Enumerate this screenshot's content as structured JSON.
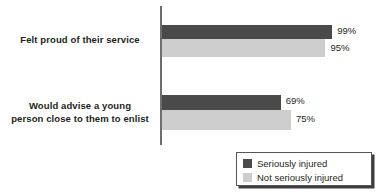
{
  "chart_data": {
    "type": "bar",
    "orientation": "horizontal",
    "title": "",
    "subtitle": "",
    "xlabel": "",
    "ylabel": "",
    "grid": false,
    "xlim": [
      0,
      100
    ],
    "legend_position": "bottom-right",
    "categories": [
      "Felt proud of their service",
      "Would advise a young person close to them to enlist"
    ],
    "category_lines": [
      [
        "Felt proud of their service"
      ],
      [
        "Would advise a young",
        "person close to them to enlist"
      ]
    ],
    "series": [
      {
        "name": "Seriously injured",
        "color": "#4a4a4a",
        "values": [
          99,
          95
        ],
        "value_labels": [
          "99%",
          "69%"
        ]
      },
      {
        "name": "Not seriously injured",
        "color": "#cdcdcd",
        "values": [
          95,
          75
        ],
        "value_labels": [
          "95%",
          "75%"
        ]
      }
    ],
    "bars": [
      {
        "group": 0,
        "series": 0,
        "value": 99,
        "label": "99%"
      },
      {
        "group": 0,
        "series": 1,
        "value": 95,
        "label": "95%"
      },
      {
        "group": 1,
        "series": 0,
        "value": 69,
        "label": "69%"
      },
      {
        "group": 1,
        "series": 1,
        "value": 75,
        "label": "75%"
      }
    ]
  },
  "legend": {
    "items": [
      {
        "label": "Seriously injured",
        "color": "#4a4a4a"
      },
      {
        "label": "Not seriously injured",
        "color": "#cdcdcd"
      }
    ]
  },
  "colors": {
    "series_0": "#4a4a4a",
    "series_1": "#cdcdcd",
    "axis": "#6d6d6d",
    "text": "#231f20",
    "background": "#ffffff",
    "legend_border": "#55555a",
    "legend_shadow": "#3d3d3d"
  }
}
